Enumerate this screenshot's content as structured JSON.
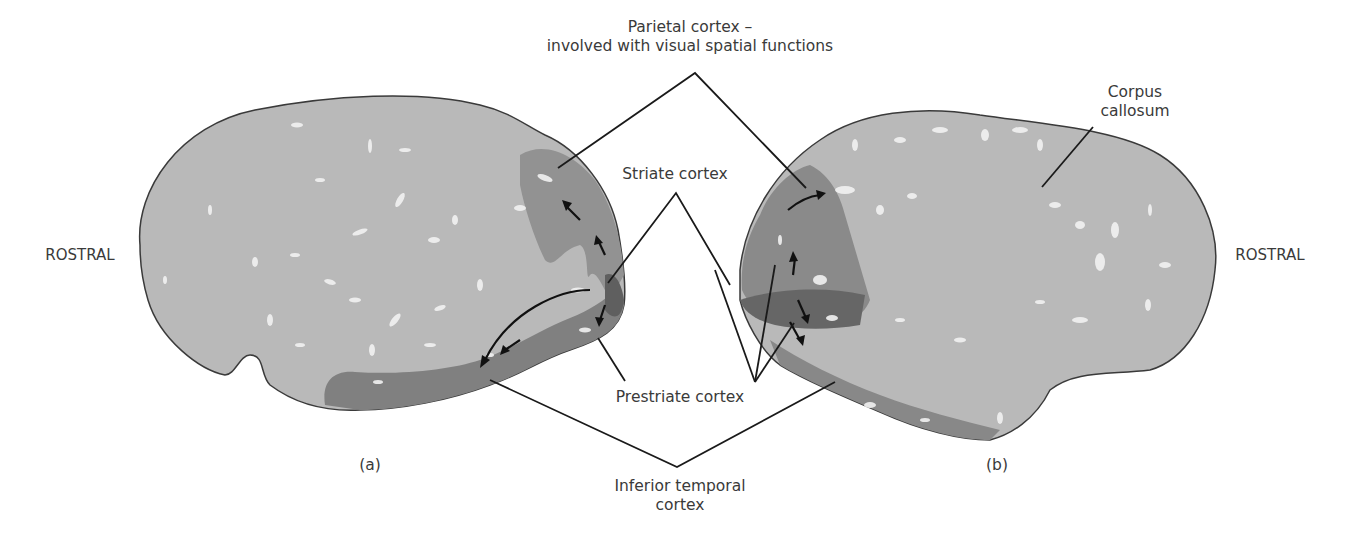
{
  "labels": {
    "parietal_line1": "Parietal cortex –",
    "parietal_line2": "involved with visual spatial functions",
    "striate": "Striate cortex",
    "prestriate": "Prestriate cortex",
    "inferior_temporal_line1": "Inferior temporal",
    "inferior_temporal_line2": "cortex",
    "corpus_line1": "Corpus",
    "corpus_line2": "callosum",
    "rostral_left": "ROSTRAL",
    "rostral_right": "ROSTRAL",
    "panel_a": "(a)",
    "panel_b": "(b)"
  },
  "colors": {
    "brain_fill": "#b9b9b9",
    "region_mid": "#8f8f8f",
    "region_dark": "#6d6d6d",
    "outline": "#3a3a3a",
    "leader_line": "#1a1a1a",
    "highlight": "#f2f2f2"
  }
}
